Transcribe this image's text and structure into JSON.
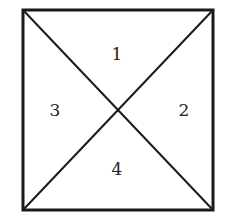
{
  "diagram": {
    "square": {
      "x1": 23,
      "y1": 10,
      "x2": 213,
      "y2": 210
    },
    "line_color": "#1a1a1a",
    "regions": [
      {
        "id": "top",
        "label": "1"
      },
      {
        "id": "right",
        "label": "2"
      },
      {
        "id": "left",
        "label": "3"
      },
      {
        "id": "bottom",
        "label": "4"
      }
    ]
  }
}
